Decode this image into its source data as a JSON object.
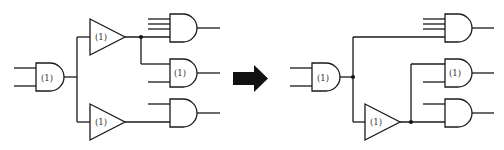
{
  "figure": {
    "left_circuit": {
      "input_gate": {
        "type": "AND",
        "label": "(1)",
        "inputs": 2
      },
      "buffers": [
        {
          "id": "top",
          "type": "BUFFER",
          "label": "(1)"
        },
        {
          "id": "bottom",
          "type": "BUFFER",
          "label": "(1)"
        }
      ],
      "output_gates": [
        {
          "id": "top",
          "type": "AND",
          "label": "",
          "inputs": 5,
          "driven_by": "top buffer"
        },
        {
          "id": "middle",
          "type": "AND",
          "label": "(1)",
          "inputs": 2,
          "driven_by": "top buffer"
        },
        {
          "id": "bottom",
          "type": "AND",
          "label": "",
          "inputs": 2,
          "driven_by": "bottom buffer"
        }
      ]
    },
    "arrow": {
      "direction": "right",
      "color": "#111111"
    },
    "right_circuit": {
      "input_gate": {
        "type": "AND",
        "label": "(1)",
        "inputs": 2
      },
      "buffers": [
        {
          "id": "single",
          "type": "BUFFER",
          "label": "(1)"
        }
      ],
      "output_gates": [
        {
          "id": "top",
          "type": "AND",
          "label": "",
          "inputs": 5,
          "driven_by": "input gate directly"
        },
        {
          "id": "middle",
          "type": "AND",
          "label": "(1)",
          "inputs": 2,
          "driven_by": "buffer"
        },
        {
          "id": "bottom",
          "type": "AND",
          "label": "",
          "inputs": 2,
          "driven_by": "buffer"
        }
      ]
    },
    "labels": {
      "left_input_gate": "(1)",
      "left_top_buffer": "(1)",
      "left_bottom_buffer": "(1)",
      "left_middle_and": "(1)",
      "right_input_gate": "(1)",
      "right_buffer": "(1)",
      "right_middle_and": "(1)"
    },
    "colors": {
      "stroke": "#1a1a1a",
      "background": "#ffffff"
    }
  }
}
